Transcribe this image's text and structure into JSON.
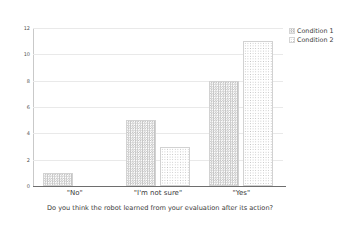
{
  "chart_data": {
    "type": "bar",
    "title": "",
    "subtitle": "",
    "xlabel": "Do you think the robot learned from your evaluation after its action?",
    "ylabel": "",
    "categories": [
      "\"No\"",
      "\"I'm not sure\"",
      "\"Yes\""
    ],
    "series": [
      {
        "name": "Condition 1",
        "values": [
          1,
          5,
          8
        ]
      },
      {
        "name": "Condition 2",
        "values": [
          0,
          3,
          11
        ]
      }
    ],
    "ylim": [
      0,
      12
    ],
    "yticks": [
      0,
      2,
      4,
      6,
      8,
      10,
      12
    ],
    "ytick_labels": [
      "0",
      "2",
      "4",
      "6",
      "8",
      "10",
      "12"
    ],
    "grid": true,
    "grid_axis": "y",
    "legend_position": "top-right",
    "colors": {
      "series_1_fill": "#c4c4c4",
      "series_2_fill": "#c0c0c0",
      "gridline": "#e9e9e9",
      "axis": "#6e6e6e",
      "text": "#3a3a3a",
      "background": "#ffffff"
    }
  },
  "legend": {
    "entries": [
      {
        "label": "Condition 1"
      },
      {
        "label": "Condition 2"
      }
    ]
  },
  "caption": {
    "text": "Do you think the robot learned from your evaluation after its action?"
  }
}
